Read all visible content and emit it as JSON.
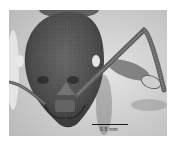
{
  "image": {
    "subject": "Ant head, frontal view (specimen photograph)",
    "palette": "grayscale",
    "colors": {
      "background": "#ffffff",
      "frame_bg": "#d9d9d9",
      "head": "#5a5a5a",
      "head_dark": "#3a3a3a",
      "eye": "#e8e8e8",
      "scale_bar": "#1a1a1a"
    }
  },
  "scale_bar": {
    "label": "0.5 mm"
  }
}
